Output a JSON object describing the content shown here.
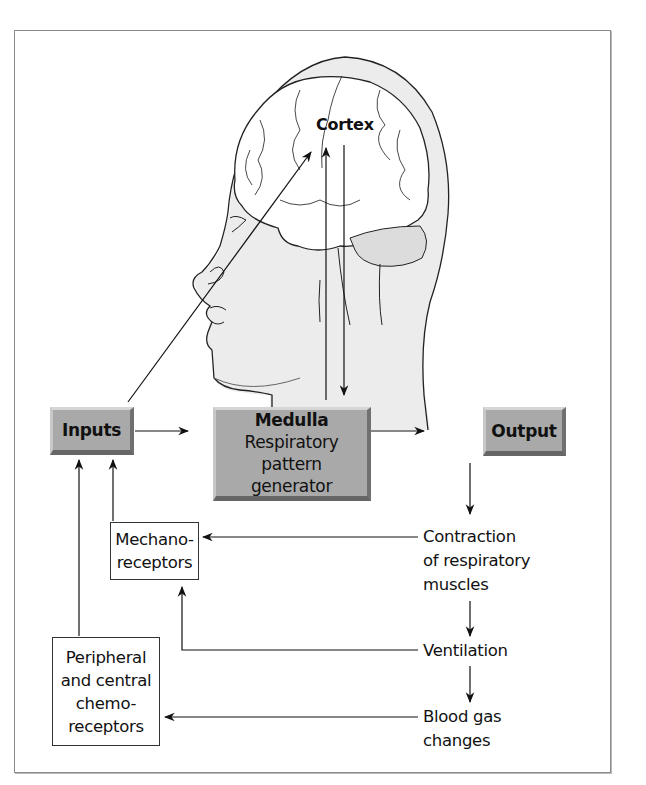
{
  "diagram": {
    "type": "flowchart",
    "illustration": "head-with-brain-profile",
    "nodes": {
      "cortex": {
        "label": "Cortex"
      },
      "inputs": {
        "label": "Inputs"
      },
      "medulla": {
        "title": "Medulla",
        "line1": "Respiratory pattern",
        "line2": "generator"
      },
      "output": {
        "label": "Output"
      },
      "mechanoreceptors": {
        "line1": "Mechano-",
        "line2": "receptors"
      },
      "chemoreceptors": {
        "line1": "Peripheral",
        "line2": "and central",
        "line3": "chemo-",
        "line4": "receptors"
      },
      "contraction": {
        "line1": "Contraction",
        "line2": "of respiratory",
        "line3": "muscles"
      },
      "ventilation": {
        "label": "Ventilation"
      },
      "blood_gas": {
        "line1": "Blood gas",
        "line2": "changes"
      }
    },
    "edges": [
      {
        "from": "Inputs",
        "to": "Cortex"
      },
      {
        "from": "Medulla",
        "to": "Cortex"
      },
      {
        "from": "Cortex",
        "to": "Medulla"
      },
      {
        "from": "Inputs",
        "to": "Medulla"
      },
      {
        "from": "Medulla",
        "to": "Output"
      },
      {
        "from": "Output",
        "to": "Contraction of respiratory muscles"
      },
      {
        "from": "Contraction of respiratory muscles",
        "to": "Ventilation"
      },
      {
        "from": "Ventilation",
        "to": "Blood gas changes"
      },
      {
        "from": "Contraction of respiratory muscles",
        "to": "Mechanoreceptors"
      },
      {
        "from": "Ventilation",
        "to": "Mechanoreceptors"
      },
      {
        "from": "Blood gas changes",
        "to": "Peripheral and central chemoreceptors"
      },
      {
        "from": "Mechanoreceptors",
        "to": "Inputs"
      },
      {
        "from": "Peripheral and central chemoreceptors",
        "to": "Inputs"
      }
    ],
    "colors": {
      "box_fill": "#a9a9a9",
      "line": "#1a1a1a",
      "frame": "#8a8a8a",
      "head_shade": "#ececec"
    }
  }
}
